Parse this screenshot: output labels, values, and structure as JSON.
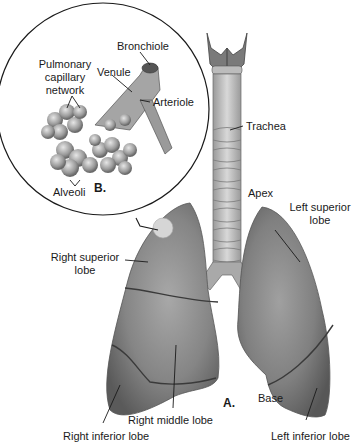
{
  "figure": {
    "panel_a": "A.",
    "panel_b": "B."
  },
  "inset_labels": {
    "bronchiole": "Bronchiole",
    "venule": "Venule",
    "arteriole": "Arteriole",
    "pulmonary_capillary_network": [
      "Pulmonary",
      "capillary",
      "network"
    ],
    "alveoli": "Alveoli"
  },
  "main_labels": {
    "trachea": "Trachea",
    "apex": "Apex",
    "left_superior_lobe": [
      "Left superior",
      "lobe"
    ],
    "right_superior_lobe": [
      "Right superior",
      "lobe"
    ],
    "right_middle_lobe": "Right middle lobe",
    "right_inferior_lobe": "Right inferior lobe",
    "left_inferior_lobe": "Left inferior lobe",
    "base": "Base"
  },
  "colors": {
    "lung_fill": "#8a8a8a",
    "lung_dark": "#5e5e5e",
    "lung_light": "#b3b3b3",
    "trachea": "#c9c9c9",
    "outline": "#1a1a1a",
    "inset_spot": "#d4d4d4"
  }
}
